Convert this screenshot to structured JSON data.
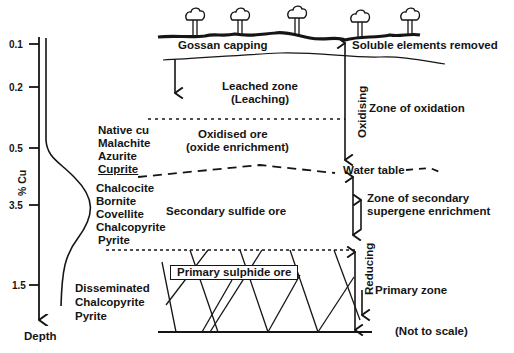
{
  "diagram": {
    "surface": {
      "left_label": "Gossan capping",
      "right_label": "Soluble elements removed",
      "tree_count": 5
    },
    "cu_axis": {
      "label": "% Cu",
      "depth_label": "Depth",
      "ticks": [
        "0.1",
        "0.2",
        "0.5",
        "3.5",
        "1.5"
      ]
    },
    "zones": {
      "leached": {
        "line1": "Leached zone",
        "line2": "(Leaching)"
      },
      "oxidised": {
        "line1": "Oxidised ore",
        "line2": "(oxide enrichment)"
      },
      "secondary": {
        "label": "Secondary sulfide ore"
      },
      "primary": {
        "label": "Primary sulphide ore"
      }
    },
    "minerals": {
      "oxide": [
        "Native cu",
        "Malachite",
        "Azurite",
        "Cuprite"
      ],
      "secondary": [
        "Chalcocite",
        "Bornite",
        "Covellite",
        "Chalcopyrite",
        "Pyrite"
      ],
      "primary": [
        "Disseminated",
        "Chalcopyrite",
        "Pyrite"
      ]
    },
    "right_labels": {
      "oxidising": "Oxidising",
      "zone_oxidation": "Zone of oxidation",
      "water_table": "Water table",
      "secondary_line1": "Zone of secondary",
      "secondary_line2": "supergene enrichment",
      "reducing": "Reducing",
      "primary_zone": "Primary  zone",
      "not_to_scale": "(Not to scale)"
    },
    "colors": {
      "ink": "#151515",
      "background": "#ffffff"
    }
  }
}
